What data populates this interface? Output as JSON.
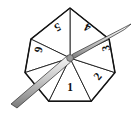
{
  "figure": {
    "kind": "probability-spinner",
    "shape_name": "heptagon",
    "sector_count": 7,
    "background_color": "#ffffff",
    "outline_color": "#141414",
    "face_color": "#ffffff",
    "needle_color_light": "#f2f2f2",
    "needle_color_mid": "#b8b8b8",
    "needle_color_dark": "#6e6e6e",
    "hub_color": "#9a9a9a"
  },
  "wheel": {
    "center": {
      "x": 70,
      "y": 58
    },
    "radius": 50,
    "vertices": [
      {
        "x": 70.0,
        "y": 8.0
      },
      {
        "x": 109.1,
        "y": 39.1
      },
      {
        "x": 115.0,
        "y": 72.6
      },
      {
        "x": 91.2,
        "y": 101.2
      },
      {
        "x": 48.8,
        "y": 101.2
      },
      {
        "x": 25.0,
        "y": 72.6
      },
      {
        "x": 30.9,
        "y": 39.1
      }
    ]
  },
  "sectors": [
    {
      "label": "1",
      "index": 0,
      "cx": 70.0,
      "cy": 88.0,
      "rotation_deg": 0,
      "data_name": "spinner-sector-1"
    },
    {
      "label": "2",
      "index": 1,
      "cx": 98.5,
      "cy": 77.0,
      "rotation_deg": -51,
      "data_name": "spinner-sector-2"
    },
    {
      "label": "3",
      "index": 2,
      "cx": 107.0,
      "cy": 48.0,
      "rotation_deg": -103,
      "data_name": "spinner-sector-3"
    },
    {
      "label": "4",
      "index": 3,
      "cx": 88.0,
      "cy": 26.5,
      "rotation_deg": -154,
      "data_name": "spinner-sector-4"
    },
    {
      "label": "5",
      "index": 4,
      "cx": 57.0,
      "cy": 26.5,
      "rotation_deg": 154,
      "data_name": "spinner-sector-5"
    },
    {
      "label": "6",
      "index": 5,
      "cx": 37.5,
      "cy": 49.5,
      "rotation_deg": 103,
      "data_name": "spinner-sector-6"
    },
    {
      "label": "7",
      "index": 6,
      "cx": 44.0,
      "cy": 79.0,
      "rotation_deg": 51,
      "data_name": "spinner-sector-7"
    }
  ],
  "needle": {
    "pointing_direction": "upper-right",
    "tip": {
      "x": 131.0,
      "y": 24.0
    },
    "tail": {
      "x": 11.0,
      "y": 104.0
    },
    "pivot": {
      "x": 70.0,
      "y": 58.0
    }
  }
}
